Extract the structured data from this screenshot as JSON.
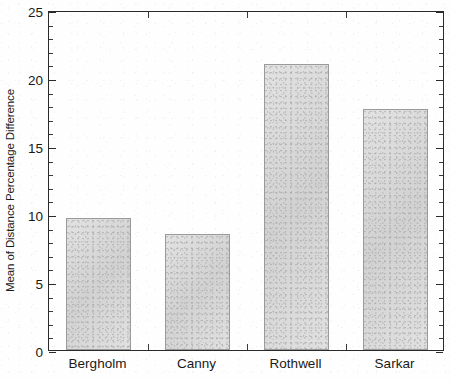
{
  "chart_data": {
    "type": "bar",
    "title": "",
    "subtitle": "",
    "xlabel": "",
    "ylabel": "Mean of Distance Percentage Difference",
    "categories": [
      "Bergholm",
      "Canny",
      "Rothwell",
      "Sarkar"
    ],
    "values": [
      9.7,
      8.5,
      21.0,
      17.7
    ],
    "ylim": [
      0,
      25
    ],
    "xlim_note": "categorical",
    "y_major_ticks": [
      0,
      5,
      10,
      15,
      20,
      25
    ],
    "y_tick_labels": [
      "0",
      "5",
      "10",
      "15",
      "20",
      "25"
    ],
    "y_minor_tick_interval": 1,
    "grid": false,
    "legend": null,
    "legend_position": "none",
    "annotations": [],
    "series": [
      {
        "name": "Mean of Distance Percentage Difference",
        "values": [
          9.7,
          8.5,
          21.0,
          17.7
        ]
      }
    ]
  },
  "style": {
    "background_color": "#ffffff",
    "axis_color": "#2a2a2a",
    "bar_fill_color": "#d3d3d3",
    "bar_edge_color": "#9a9a9a",
    "text_color": "#1a1a1a"
  }
}
